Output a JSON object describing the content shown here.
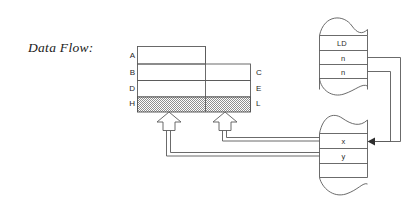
{
  "diagram": {
    "caption": "Data Flow:",
    "colors": {
      "stroke": "#5a5a5a",
      "stroke_dark": "#3d3d3d",
      "text": "#1f1f1f",
      "hatch": "#9a9a9a",
      "background": "#ffffff"
    },
    "memory_table": {
      "name": "memory-block",
      "left_labels": [
        "A",
        "B",
        "D",
        "H"
      ],
      "right_labels": [
        "C",
        "E",
        "L"
      ],
      "rows": [
        {
          "left": "A",
          "right": "",
          "span": "half",
          "fill": "none"
        },
        {
          "left": "B",
          "right": "C",
          "span": "full",
          "fill": "none"
        },
        {
          "left": "D",
          "right": "E",
          "span": "full",
          "fill": "none"
        },
        {
          "left": "H",
          "right": "L",
          "span": "full",
          "fill": "hatched"
        }
      ]
    },
    "top_register": {
      "name": "instruction-stream",
      "edge_style": "torn",
      "cells": [
        "LD",
        "n",
        "n"
      ]
    },
    "bottom_register": {
      "name": "memory-stream",
      "edge_style": "torn",
      "cells": [
        "x",
        "y"
      ]
    },
    "connectors": {
      "up_arrows": 2,
      "arrowhead_target": "x",
      "bus_sources": [
        "x",
        "y"
      ]
    }
  }
}
